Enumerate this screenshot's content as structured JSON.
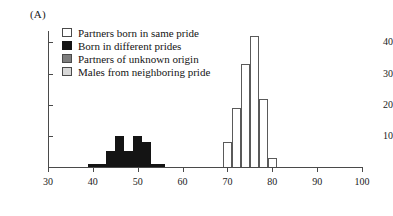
{
  "panel": {
    "label": "(A)"
  },
  "legend": {
    "position": "top-left-inside",
    "entries": [
      {
        "label": "Partners born in same pride",
        "color": "#ffffff",
        "border": "#4a4a4a"
      },
      {
        "label": "Born in different prides",
        "color": "#141414",
        "border": "#141414"
      },
      {
        "label": "Partners of unknown origin",
        "color": "#7d7d7d",
        "border": "#4a4a4a"
      },
      {
        "label": "Males from neighboring pride",
        "color": "#d8d8d8",
        "border": "#4a4a4a"
      }
    ]
  },
  "chart_data": {
    "type": "bar",
    "title": "",
    "xlabel": "",
    "ylabel": "",
    "xlim": [
      30,
      100
    ],
    "ylim": [
      0,
      44
    ],
    "grid": false,
    "bin_width": 2,
    "xticks": [
      30,
      40,
      50,
      60,
      70,
      80,
      90,
      100
    ],
    "yticks": [
      10,
      20,
      30,
      40
    ],
    "series": [
      {
        "name": "Born in different prides",
        "color": "#141414",
        "style": "filled",
        "bins": [
          {
            "x0": 39,
            "x1": 41,
            "value": 1
          },
          {
            "x0": 41,
            "x1": 43,
            "value": 1
          },
          {
            "x0": 43,
            "x1": 45,
            "value": 5
          },
          {
            "x0": 45,
            "x1": 47,
            "value": 10
          },
          {
            "x0": 47,
            "x1": 49,
            "value": 5
          },
          {
            "x0": 49,
            "x1": 51,
            "value": 10
          },
          {
            "x0": 51,
            "x1": 53,
            "value": 8
          },
          {
            "x0": 53,
            "x1": 55,
            "value": 1
          },
          {
            "x0": 55,
            "x1": 56,
            "value": 1
          }
        ]
      },
      {
        "name": "Partners born in same pride",
        "color": "#ffffff",
        "style": "hollow",
        "bins": [
          {
            "x0": 69,
            "x1": 71,
            "value": 8
          },
          {
            "x0": 71,
            "x1": 73,
            "value": 19
          },
          {
            "x0": 73,
            "x1": 75,
            "value": 33
          },
          {
            "x0": 75,
            "x1": 77,
            "value": 42
          },
          {
            "x0": 77,
            "x1": 79,
            "value": 22
          },
          {
            "x0": 79,
            "x1": 81,
            "value": 3
          }
        ]
      }
    ]
  }
}
